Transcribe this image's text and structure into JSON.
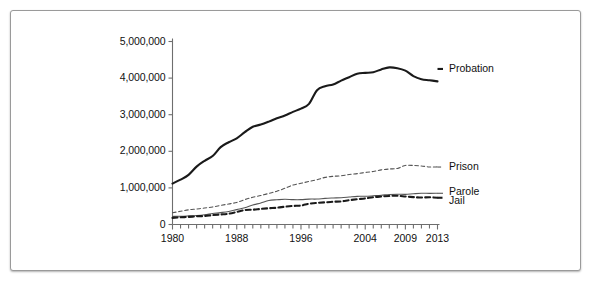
{
  "figure": {
    "background": "#ffffff",
    "frame_color": "#9a9a9a",
    "axis_color": "#6e6e6e",
    "ink_color": "#1a1a1a",
    "thin_color": "#555555"
  },
  "chart_data": {
    "type": "line",
    "title": "",
    "xlabel": "",
    "ylabel": "",
    "xlim": [
      1980,
      2013
    ],
    "ylim": [
      0,
      5000000
    ],
    "grid": false,
    "legend_position": "right-inline",
    "y_ticks": [
      0,
      1000000,
      2000000,
      3000000,
      4000000,
      5000000
    ],
    "y_tick_labels": [
      "0",
      "1,000,000",
      "2,000,000",
      "3,000,000",
      "4,000,000",
      "5,000,000"
    ],
    "x_ticks": [
      1980,
      1988,
      1996,
      2004,
      2009,
      2013
    ],
    "x_tick_labels": [
      "1980",
      "1988",
      "1996",
      "2004",
      "2009",
      "2013"
    ],
    "x_minor_ticks_every": 1,
    "x": [
      1980,
      1981,
      1982,
      1983,
      1984,
      1985,
      1986,
      1987,
      1988,
      1989,
      1990,
      1991,
      1992,
      1993,
      1994,
      1995,
      1996,
      1997,
      1998,
      1999,
      2000,
      2001,
      2002,
      2003,
      2004,
      2005,
      2006,
      2007,
      2008,
      2009,
      2010,
      2011,
      2012,
      2013
    ],
    "series": [
      {
        "name": "Probation",
        "style": "solid",
        "width": 2.1,
        "color": "#1a1a1a",
        "label_x": 2015,
        "label_y": 4250000,
        "values": [
          1118000,
          1225000,
          1357000,
          1582000,
          1740000,
          1870000,
          2114000,
          2247000,
          2356000,
          2522000,
          2670000,
          2729000,
          2811000,
          2903000,
          2981000,
          3078000,
          3165000,
          3297000,
          3670000,
          3779000,
          3826000,
          3932000,
          4024000,
          4120000,
          4143000,
          4162000,
          4236000,
          4293000,
          4271000,
          4203000,
          4055000,
          3971000,
          3942000,
          3910000
        ]
      },
      {
        "name": "Prison",
        "style": "dashed",
        "width": 1.1,
        "color": "#555555",
        "label_x": 2015,
        "label_y": 1570000,
        "values": [
          320000,
          360000,
          402000,
          423000,
          449000,
          480000,
          522000,
          560000,
          603000,
          680000,
          743000,
          792000,
          850000,
          909000,
          990000,
          1078000,
          1127000,
          1176000,
          1224000,
          1287000,
          1316000,
          1330000,
          1367000,
          1390000,
          1421000,
          1449000,
          1492000,
          1517000,
          1532000,
          1614000,
          1613000,
          1599000,
          1571000,
          1574000
        ]
      },
      {
        "name": "Parole",
        "style": "solid",
        "width": 1.1,
        "color": "#555555",
        "label_x": 2015,
        "label_y": 850000,
        "values": [
          220000,
          225000,
          235000,
          246000,
          266000,
          300000,
          325000,
          356000,
          407000,
          456000,
          531000,
          590000,
          658000,
          676000,
          690000,
          679000,
          679000,
          694000,
          696000,
          714000,
          724000,
          732000,
          750000,
          769000,
          771000,
          784000,
          799000,
          821000,
          828000,
          824000,
          841000,
          854000,
          851000,
          853000
        ]
      },
      {
        "name": "Jail",
        "style": "dashed",
        "width": 2.1,
        "color": "#1a1a1a",
        "label_x": 2015,
        "label_y": 560000,
        "values": [
          182000,
          196000,
          209000,
          223000,
          234000,
          256000,
          274000,
          295000,
          343000,
          395000,
          405000,
          426000,
          444000,
          459000,
          486000,
          507000,
          518000,
          567000,
          592000,
          605000,
          621000,
          631000,
          665000,
          691000,
          714000,
          747000,
          766000,
          780000,
          785000,
          767000,
          749000,
          736000,
          745000,
          731000
        ]
      }
    ]
  },
  "axis_labels": {
    "y": [
      {
        "text": "5,000,000",
        "value": 5000000
      },
      {
        "text": "4,000,000",
        "value": 4000000
      },
      {
        "text": "3,000,000",
        "value": 3000000
      },
      {
        "text": "2,000,000",
        "value": 2000000
      },
      {
        "text": "1,000,000",
        "value": 1000000
      },
      {
        "text": "0",
        "value": 0
      }
    ],
    "x": [
      {
        "text": "1980",
        "value": 1980
      },
      {
        "text": "1988",
        "value": 1988
      },
      {
        "text": "1996",
        "value": 1996
      },
      {
        "text": "2004",
        "value": 2004
      },
      {
        "text": "2009",
        "value": 2009
      },
      {
        "text": "2013",
        "value": 2013
      }
    ]
  },
  "series_labels": [
    {
      "text": "Probation"
    },
    {
      "text": "Prison"
    },
    {
      "text": "Parole"
    },
    {
      "text": "Jail"
    }
  ]
}
